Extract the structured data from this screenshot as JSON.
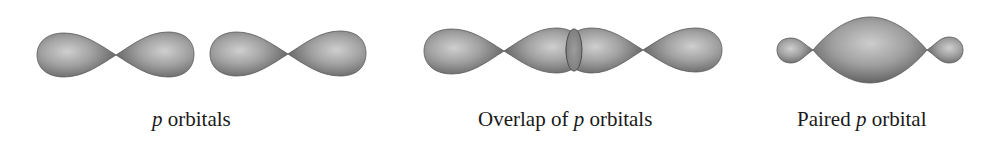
{
  "figure": {
    "panels": [
      {
        "id": "p-orbitals",
        "caption_italic": "p",
        "caption_rest": " orbitals",
        "caption_full": "p orbitals",
        "shapes": "two separate dumbbell-shaped p orbitals side by side"
      },
      {
        "id": "overlap",
        "caption_prefix": "Overlap of ",
        "caption_italic": "p",
        "caption_rest": " orbitals",
        "caption_full": "Overlap of p orbitals",
        "shapes": "two p orbitals whose inner lobes overlap in a small lens-shaped region"
      },
      {
        "id": "paired",
        "caption_prefix": "Paired ",
        "caption_italic": "p",
        "caption_rest": " orbital",
        "caption_full": "Paired p orbital",
        "shapes": "one large central lobe with two small outer lobes"
      }
    ],
    "colors": {
      "lobe_light": "#c8c8c8",
      "lobe_mid": "#9a9a9a",
      "lobe_dark": "#5a5a5a",
      "text": "#1a1a1a",
      "background": "#ffffff"
    }
  }
}
